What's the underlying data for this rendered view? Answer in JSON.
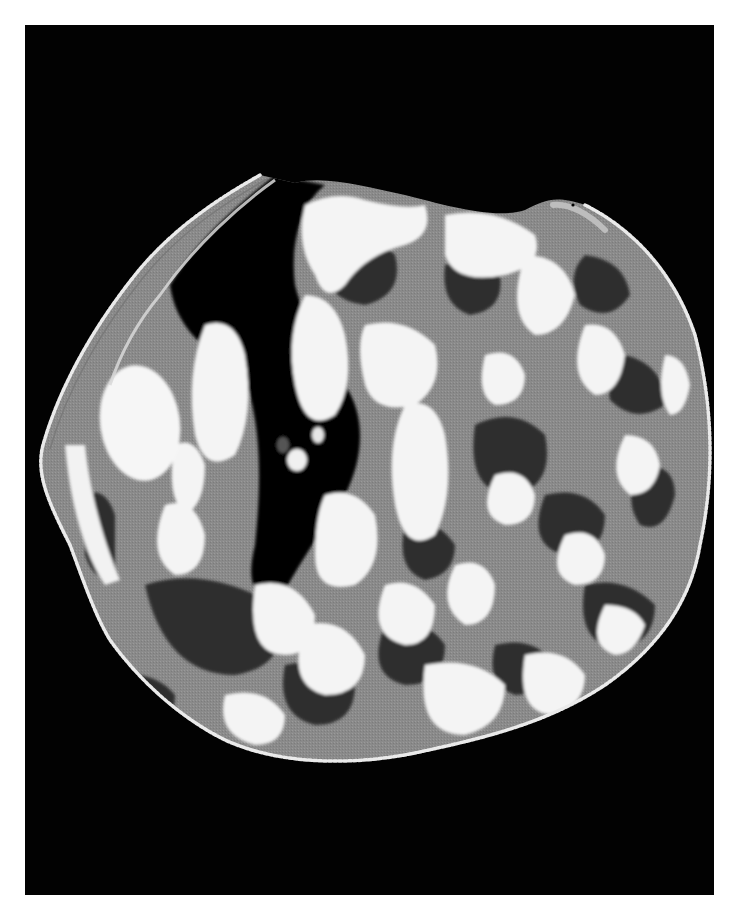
{
  "figure": {
    "kind": "grayscale quantized cross-sectional scan",
    "background_color": "#ffffff",
    "frame_color": "#020202",
    "levels": {
      "black": "#050505",
      "dark_gray": "#3a3a3a",
      "mid_gray": "#8a8a8a",
      "light_gray": "#bdbdbd",
      "white": "#f4f4f4"
    },
    "regions": [
      "outer beaded rim",
      "large bright oval lobe (left)",
      "dark lumen (upper center-left)",
      "mottled textured interior"
    ]
  }
}
